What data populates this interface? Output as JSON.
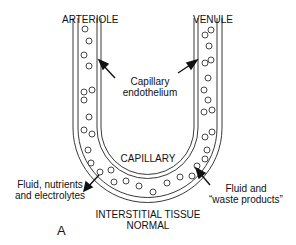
{
  "diagram": {
    "panel_letter": "A",
    "labels": {
      "arteriole": "ARTERIOLE",
      "venule": "VENULE",
      "capillary_endothelium_line1": "Capillary",
      "capillary_endothelium_line2": "endothelium",
      "capillary": "CAPILLARY",
      "fluid_in_line1": "Fluid, nutrients",
      "fluid_in_line2": "and electrolytes",
      "fluid_out_line1": "Fluid and",
      "fluid_out_line2": "“waste products”",
      "interstitial_line1": "INTERSTITIAL TISSUE",
      "interstitial_line2": "NORMAL"
    }
  }
}
